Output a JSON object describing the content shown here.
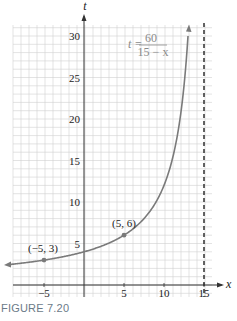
{
  "chart_data": {
    "type": "line",
    "title": "",
    "equation": {
      "lhs": "t =",
      "numerator": "60",
      "denominator": "15 − x"
    },
    "xlabel": "x",
    "ylabel": "t",
    "xlim": [
      -10,
      16.5
    ],
    "ylim": [
      -3,
      31.5
    ],
    "xticks": [
      -5,
      5,
      10,
      15
    ],
    "xtick_labels": [
      "−5",
      "5",
      "10",
      "15"
    ],
    "yticks": [
      5,
      10,
      15,
      20,
      25,
      30
    ],
    "ytick_labels": [
      "5",
      "10",
      "15",
      "20",
      "25",
      "30"
    ],
    "grid": true,
    "asymptote": {
      "x": 15,
      "style": "dashed"
    },
    "series": [
      {
        "name": "t = 60/(15 − x)",
        "function": "60/(15-x)",
        "x_range": [
          -10,
          13.05
        ]
      }
    ],
    "points": [
      {
        "x": -5,
        "y": 3,
        "label": "(−5, 3)"
      },
      {
        "x": 5,
        "y": 6,
        "label": "(5, 6)"
      }
    ]
  },
  "caption": "FIGURE 7.20",
  "colors": {
    "curve": "#7a7a7a",
    "grid": "#d0d0d0",
    "axis": "#333333",
    "caption": "#6b7a88",
    "equation": "#8a8a8a"
  }
}
